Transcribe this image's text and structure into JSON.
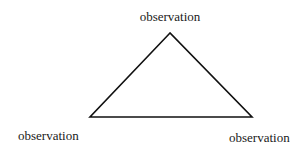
{
  "diagram": {
    "type": "triangle",
    "vertices": {
      "top": {
        "x": 170,
        "y": 33,
        "label": "observation"
      },
      "bottom_left": {
        "x": 90,
        "y": 117,
        "label": "observation"
      },
      "bottom_right": {
        "x": 252,
        "y": 117,
        "label": "observation"
      }
    },
    "stroke_color": "#111111",
    "background_color": "#ffffff"
  }
}
